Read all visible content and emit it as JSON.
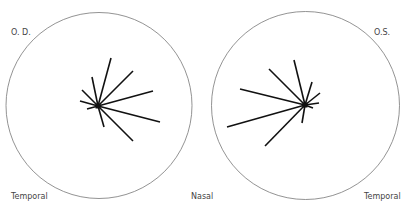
{
  "labels": {
    "od": "O. D.",
    "os": "O.S.",
    "temporal_left": "Temporal",
    "nasal": "Nasal",
    "temporal_right": "Temporal"
  },
  "diagrams": [
    {
      "eye": "O. D.",
      "circle": {
        "cx": 99,
        "cy": 105.5,
        "r": 93
      },
      "center": {
        "x": 98,
        "y": 106
      },
      "rays": [
        [
          111,
          58
        ],
        [
          133,
          71
        ],
        [
          153,
          91
        ],
        [
          160,
          122
        ],
        [
          133,
          141
        ],
        [
          104,
          127
        ],
        [
          87,
          109
        ],
        [
          80,
          101
        ],
        [
          82,
          90
        ],
        [
          92,
          77
        ]
      ]
    },
    {
      "eye": "O.S.",
      "circle": {
        "cx": 305.5,
        "cy": 105.5,
        "r": 94
      },
      "center": {
        "x": 305,
        "y": 105
      },
      "rays": [
        [
          294,
          60
        ],
        [
          269,
          69
        ],
        [
          240,
          89
        ],
        [
          227,
          127
        ],
        [
          265,
          146
        ],
        [
          302,
          123
        ],
        [
          312,
          82
        ],
        [
          320,
          93
        ],
        [
          319,
          103
        ],
        [
          313,
          108
        ]
      ]
    }
  ],
  "colors": {
    "circle": "#777777",
    "ray": "#111111",
    "text": "#444444"
  }
}
